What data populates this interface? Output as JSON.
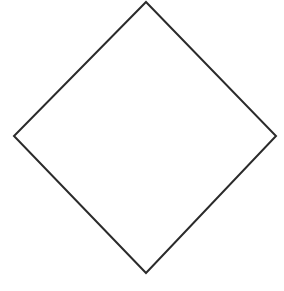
{
  "figure": {
    "shape_name": "diamond",
    "canvas": {
      "width": 284,
      "height": 291,
      "background_color": "#ffffff"
    },
    "style": {
      "stroke_color": "#2b2b2b",
      "stroke_width": 2,
      "fill_color": "none",
      "line_join": "miter"
    },
    "vertices": [
      {
        "name": "top-vertex",
        "x": 146,
        "y": 2
      },
      {
        "name": "right-vertex",
        "x": 276,
        "y": 136
      },
      {
        "name": "bottom-vertex",
        "x": 146,
        "y": 273
      },
      {
        "name": "left-vertex",
        "x": 14,
        "y": 136
      }
    ],
    "points_attr": "146,2 276,136 146,273 14,136",
    "edges": [
      {
        "name": "upper-left-edge",
        "from": "left-vertex",
        "to": "top-vertex"
      },
      {
        "name": "upper-right-edge",
        "from": "top-vertex",
        "to": "right-vertex"
      },
      {
        "name": "lower-right-edge",
        "from": "right-vertex",
        "to": "bottom-vertex"
      },
      {
        "name": "lower-left-edge",
        "from": "bottom-vertex",
        "to": "left-vertex"
      }
    ]
  }
}
